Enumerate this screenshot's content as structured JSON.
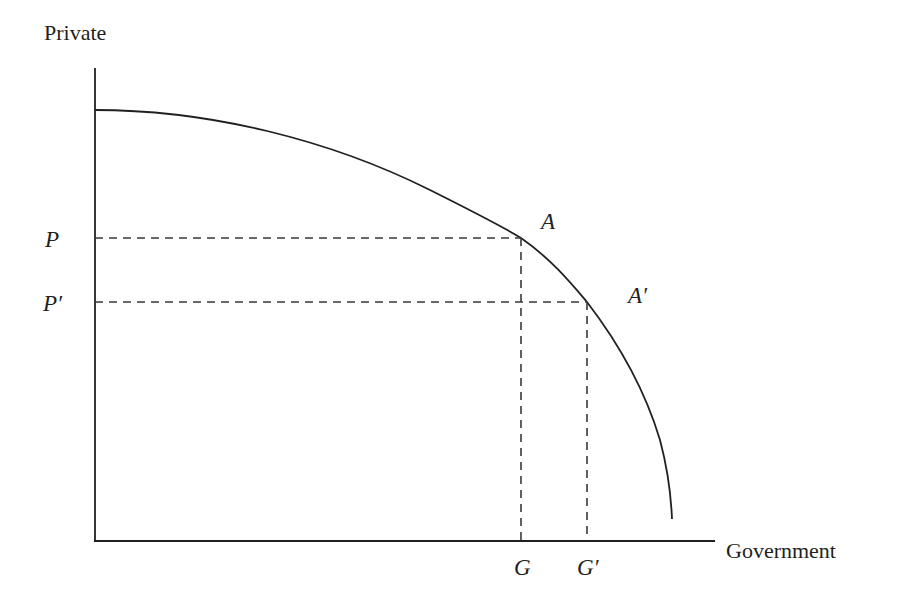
{
  "diagram": {
    "type": "production-possibility-frontier",
    "y_axis_label": "Private",
    "x_axis_label": "Government",
    "points": [
      {
        "name": "A",
        "label": "A",
        "x_label": "G",
        "y_label": "P"
      },
      {
        "name": "A_prime",
        "label": "A′",
        "x_label": "G′",
        "y_label": "P′"
      }
    ],
    "colors": {
      "line": "#231f20",
      "dashed": "#3a3a3a",
      "background": "#ffffff"
    }
  }
}
